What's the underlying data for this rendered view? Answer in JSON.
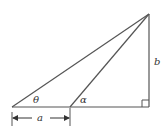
{
  "diagram": {
    "type": "right-triangle",
    "labels": {
      "theta": "θ",
      "alpha": "α",
      "a": "a",
      "b": "b"
    },
    "points": {
      "left_vertex": [
        12,
        107
      ],
      "middle_vertex": [
        70,
        107
      ],
      "right_angle_vertex": [
        149,
        107
      ],
      "apex": [
        149,
        14
      ]
    },
    "colors": {
      "stroke": "#555555",
      "text": "#333333"
    }
  }
}
